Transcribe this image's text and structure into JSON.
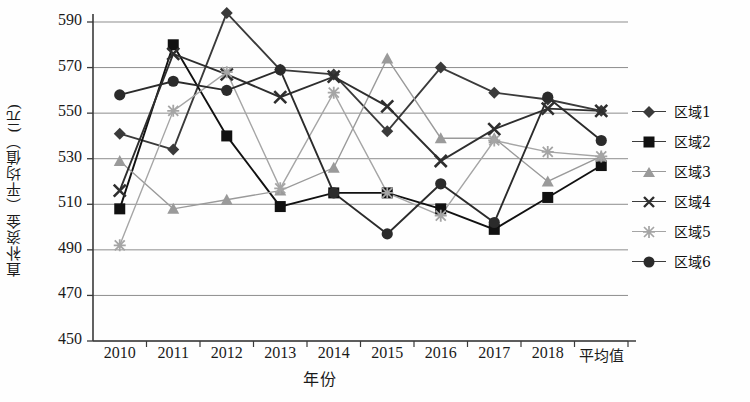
{
  "chart_data": {
    "type": "line",
    "title": "",
    "xlabel": "年份",
    "ylabel": "直补资金（平均值）(元)",
    "categories": [
      "2010",
      "2011",
      "2012",
      "2013",
      "2014",
      "2015",
      "2016",
      "2017",
      "2018",
      "平均值"
    ],
    "ylim": [
      450,
      590
    ],
    "ytick_values": [
      590,
      570,
      550,
      530,
      510,
      490,
      470,
      450
    ],
    "grid": true,
    "legend_position": "right",
    "series": [
      {
        "name": "区域1",
        "marker": "diamond",
        "color": "#3a3a3a",
        "values": [
          541,
          534,
          594,
          569,
          567,
          542,
          570,
          559,
          556,
          551
        ]
      },
      {
        "name": "区域2",
        "marker": "square",
        "color": "#111111",
        "values": [
          508,
          580,
          540,
          509,
          515,
          515,
          508,
          499,
          513,
          527
        ]
      },
      {
        "name": "区域3",
        "marker": "triangle",
        "color": "#9a9a9a",
        "values": [
          529,
          508,
          512,
          516,
          526,
          574,
          539,
          539,
          520,
          531
        ]
      },
      {
        "name": "区域4",
        "marker": "cross",
        "color": "#2e2e2e",
        "values": [
          516,
          576,
          567,
          557,
          566,
          553,
          529,
          543,
          552,
          551
        ]
      },
      {
        "name": "区域5",
        "marker": "star",
        "color": "#a5a5a5",
        "values": [
          492,
          551,
          568,
          517,
          559,
          515,
          505,
          538,
          533,
          531
        ]
      },
      {
        "name": "区域6",
        "marker": "circle",
        "color": "#2b2b2b",
        "values": [
          558,
          564,
          560,
          569,
          515,
          497,
          519,
          502,
          557,
          538
        ]
      }
    ]
  },
  "legend": {
    "items": [
      {
        "label": "区域1"
      },
      {
        "label": "区域2"
      },
      {
        "label": "区域3"
      },
      {
        "label": "区域4"
      },
      {
        "label": "区域5"
      },
      {
        "label": "区域6"
      }
    ]
  }
}
